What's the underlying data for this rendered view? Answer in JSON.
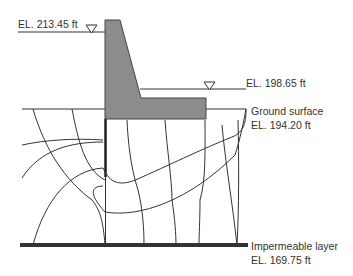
{
  "diagram": {
    "labels": {
      "headwater": "EL. 213.45 ft",
      "tailwater": "EL. 198.65 ft",
      "ground_surface": "Ground surface",
      "ground_elevation": "EL. 194.20 ft",
      "impermeable": "Impermeable layer",
      "impermeable_elevation": "EL. 169.75 ft"
    },
    "colors": {
      "dam_fill": "#8c8c8c",
      "line": "#333333",
      "impermeable": "#333333"
    },
    "elements": [
      "headwater-level",
      "tailwater-level",
      "dam",
      "sheet-pile",
      "ground-surface",
      "flow-lines",
      "equipotential-lines",
      "impermeable-layer"
    ]
  }
}
